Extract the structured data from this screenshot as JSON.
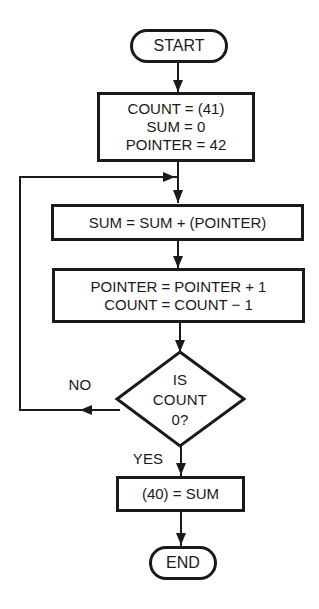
{
  "flowchart": {
    "start": "START",
    "init": [
      "COUNT = (41)",
      "SUM = 0",
      "POINTER = 42"
    ],
    "accumulate": "SUM = SUM + (POINTER)",
    "update": [
      "POINTER = POINTER + 1",
      "COUNT = COUNT − 1"
    ],
    "decision": [
      "IS",
      "COUNT",
      "0?"
    ],
    "no_label": "NO",
    "yes_label": "YES",
    "store": "(40) = SUM",
    "end": "END"
  }
}
